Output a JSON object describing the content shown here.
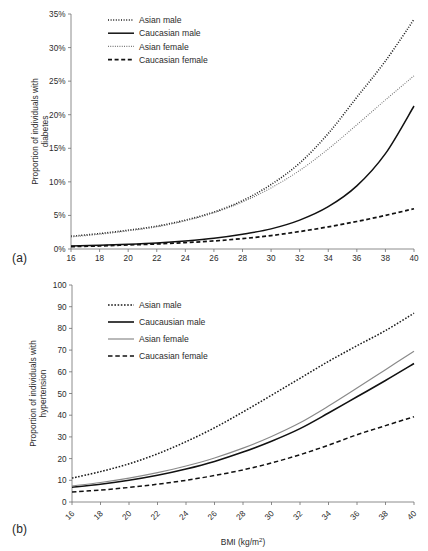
{
  "figure": {
    "panel_a_label": "(a)",
    "panel_b_label": "(b)"
  },
  "chart_data": [
    {
      "id": "a",
      "type": "line",
      "title": "",
      "panel_label": "(a)",
      "xlabel": "",
      "ylabel": "Proportion of individuals with diabetes",
      "ylabel_line1": "Proportion of individuals with",
      "ylabel_line2": "diabetes",
      "xlim": [
        16,
        40
      ],
      "ylim": [
        0,
        35
      ],
      "xticks": [
        16,
        18,
        20,
        22,
        24,
        26,
        28,
        30,
        32,
        34,
        36,
        38,
        40
      ],
      "xticklabels": [
        "16",
        "18",
        "20",
        "22",
        "24",
        "26",
        "28",
        "30",
        "32",
        "34",
        "36",
        "38",
        "40"
      ],
      "yticks": [
        0,
        5,
        10,
        15,
        20,
        25,
        30,
        35
      ],
      "yticklabels": [
        "0%",
        "5%",
        "10%",
        "15%",
        "20%",
        "25%",
        "30%",
        "35%"
      ],
      "grid": false,
      "legend_position": "top-left",
      "x": [
        16,
        18,
        20,
        22,
        24,
        26,
        28,
        30,
        32,
        34,
        36,
        38,
        40
      ],
      "series": [
        {
          "name": "Asian male",
          "style": "dotted-fine",
          "color": "#1a1a1a",
          "width": 1.6,
          "dash": "1,1.6",
          "values": [
            1.9,
            2.3,
            2.8,
            3.4,
            4.3,
            5.5,
            7.2,
            9.6,
            12.8,
            17.2,
            22.6,
            28.0,
            34.2
          ]
        },
        {
          "name": "Caucasian male",
          "style": "solid",
          "color": "#111111",
          "width": 1.5,
          "dash": "none",
          "values": [
            0.45,
            0.55,
            0.7,
            0.9,
            1.2,
            1.6,
            2.2,
            3.0,
            4.3,
            6.3,
            9.4,
            14.2,
            21.3
          ]
        },
        {
          "name": "Asian female",
          "style": "dotted-light",
          "color": "#6b6b6b",
          "width": 1.1,
          "dash": "0.9,1.4",
          "values": [
            1.8,
            2.2,
            2.7,
            3.3,
            4.2,
            5.4,
            7.0,
            9.1,
            11.7,
            14.9,
            18.5,
            22.2,
            25.8
          ]
        },
        {
          "name": "Caucasian female",
          "style": "dashed",
          "color": "#111111",
          "width": 1.7,
          "dash": "4,2.6",
          "values": [
            0.35,
            0.45,
            0.6,
            0.75,
            0.95,
            1.2,
            1.55,
            2.0,
            2.6,
            3.3,
            4.1,
            5.0,
            6.0
          ]
        }
      ],
      "legend": [
        {
          "label": "Asian male",
          "style": "dotted-fine"
        },
        {
          "label": "Caucasian male",
          "style": "solid"
        },
        {
          "label": "Asian female",
          "style": "dotted-light"
        },
        {
          "label": "Caucasian female",
          "style": "dashed"
        }
      ]
    },
    {
      "id": "b",
      "type": "line",
      "title": "",
      "panel_label": "(b)",
      "xlabel": "BMI (kg/m2)",
      "xlabel_base": "BMI (kg/m",
      "xlabel_sup": "2",
      "xlabel_tail": ")",
      "ylabel": "Proportion of individuals with hypertension",
      "ylabel_line1": "Proportion of individuals with",
      "ylabel_line2": "hypertension",
      "xlim": [
        16,
        40
      ],
      "ylim": [
        0,
        100
      ],
      "xticks": [
        16,
        18,
        20,
        22,
        24,
        26,
        28,
        30,
        32,
        34,
        36,
        38,
        40
      ],
      "xticklabels": [
        "16",
        "18",
        "20",
        "22",
        "24",
        "26",
        "28",
        "30",
        "32",
        "34",
        "36",
        "38",
        "40"
      ],
      "yticks": [
        0,
        10,
        20,
        30,
        40,
        50,
        60,
        70,
        80,
        90,
        100
      ],
      "yticklabels": [
        "0",
        "10",
        "20",
        "30",
        "40",
        "50",
        "60",
        "70",
        "80",
        "90",
        "100"
      ],
      "grid": false,
      "legend_position": "top-left",
      "x": [
        16,
        18,
        20,
        22,
        24,
        26,
        28,
        30,
        32,
        34,
        36,
        38,
        40
      ],
      "series": [
        {
          "name": "Asian male",
          "style": "dotted-fine",
          "color": "#1a1a1a",
          "width": 1.5,
          "dash": "1.6,1.6",
          "values": [
            11.0,
            14.0,
            17.6,
            22.2,
            27.8,
            34.2,
            41.5,
            49.2,
            57.0,
            64.8,
            72.0,
            79.0,
            87.0
          ]
        },
        {
          "name": "Caucausian male",
          "style": "solid",
          "color": "#111111",
          "width": 1.6,
          "dash": "none",
          "values": [
            6.8,
            8.2,
            10.0,
            12.3,
            15.2,
            18.7,
            23.0,
            28.0,
            33.8,
            41.0,
            48.5,
            56.0,
            63.8
          ]
        },
        {
          "name": "Asian female",
          "style": "solid-light",
          "color": "#8a8a8a",
          "width": 1.2,
          "dash": "none",
          "values": [
            7.4,
            9.0,
            11.0,
            13.5,
            16.6,
            20.3,
            24.8,
            30.2,
            36.5,
            44.2,
            52.5,
            61.0,
            69.5
          ]
        },
        {
          "name": "Caucasian female",
          "style": "dashed",
          "color": "#111111",
          "width": 1.5,
          "dash": "4.5,2.8",
          "values": [
            4.6,
            5.5,
            6.7,
            8.2,
            10.0,
            12.2,
            14.8,
            18.0,
            21.8,
            26.2,
            31.0,
            35.2,
            39.3
          ]
        }
      ],
      "legend": [
        {
          "label": "Asian male",
          "style": "dotted-fine"
        },
        {
          "label": "Caucausian male",
          "style": "solid"
        },
        {
          "label": "Asian female",
          "style": "solid-light"
        },
        {
          "label": "Caucasian female",
          "style": "dashed"
        }
      ]
    }
  ]
}
